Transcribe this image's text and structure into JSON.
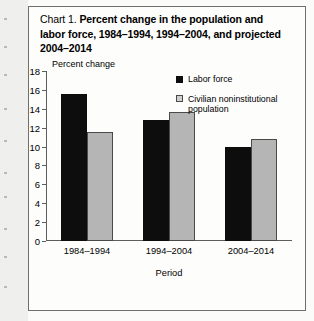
{
  "figure": {
    "label": "Chart 1.",
    "title_line1": "Percent change in the population and",
    "title_line2": "labor force, 1984–1994, 1994–2004, and projected",
    "title_line3": "2004–2014"
  },
  "chart_data": {
    "type": "bar",
    "title": "Chart 1.  Percent change in the population and labor force, 1984–1994, 1994–2004, and projected 2004–2014",
    "xlabel": "Period",
    "ylabel": "Percent change",
    "categories": [
      "1984–1994",
      "1994–2004",
      "2004–2014"
    ],
    "series": [
      {
        "name": "Labor force",
        "color": "#0d0d0d",
        "values": [
          15.6,
          12.8,
          10.0
        ]
      },
      {
        "name": "Civilian noninstitutional population",
        "color": "#b5b5b5",
        "values": [
          11.5,
          13.7,
          10.8
        ]
      }
    ],
    "ylim": [
      0,
      18
    ],
    "yticks": [
      0,
      2,
      4,
      6,
      8,
      10,
      12,
      14,
      16,
      18
    ],
    "grid": false,
    "legend_position": "upper right"
  }
}
